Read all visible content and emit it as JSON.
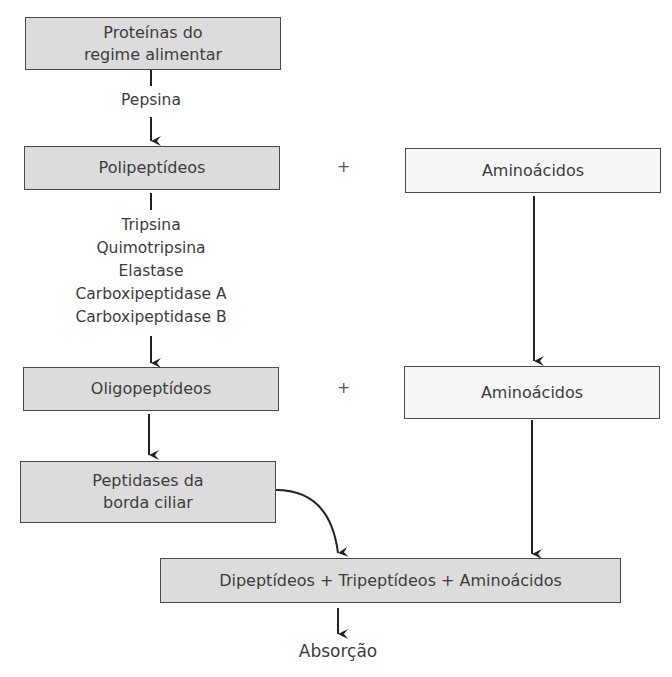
{
  "diagram": {
    "nodes": {
      "proteins": "Proteínas do\nregime alimentar",
      "polypeptides": "Polipeptídeos",
      "amino_top": "Aminoácidos",
      "oligopeptides": "Oligopeptídeos",
      "amino_mid": "Aminoácidos",
      "brush_border": "Peptidases da\nborda ciliar",
      "final": "Dipeptídeos + Tripeptídeos + Aminoácidos"
    },
    "enzymes": {
      "stomach": "Pepsina",
      "pancreatic": [
        "Tripsina",
        "Quimotripsina",
        "Elastase",
        "Carboxipeptidase A",
        "Carboxipeptidase B"
      ]
    },
    "operators": {
      "plus_top": "+",
      "plus_mid": "+"
    },
    "outcome": "Absorção",
    "colors": {
      "gray_box": "#dcdcdc",
      "light_box": "#f6f6f6",
      "stroke": "#222222"
    }
  }
}
